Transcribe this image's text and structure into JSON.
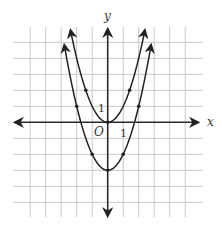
{
  "chart_data": {
    "type": "line",
    "title": "",
    "xlabel": "x",
    "ylabel": "y",
    "origin_label": "O",
    "tick_labels": {
      "x": "1",
      "y": "1"
    },
    "xlim": [
      -6,
      6
    ],
    "ylim": [
      -6,
      6
    ],
    "grid": true,
    "grid_x": [
      -5,
      -4,
      -3,
      -2,
      -1,
      0,
      1,
      2,
      3,
      4,
      5
    ],
    "grid_y": [
      -5,
      -4,
      -3,
      -2,
      -1,
      0,
      1,
      2,
      3,
      4,
      5
    ],
    "series": [
      {
        "name": "y = x^2",
        "equation": "y = x^2",
        "vertex": [
          0,
          0
        ],
        "points": [
          [
            -1.41,
            2
          ],
          [
            0,
            0
          ],
          [
            1.41,
            2
          ]
        ],
        "x_range": [
          -2.4,
          2.4
        ]
      },
      {
        "name": "y = x^2 - 3",
        "equation": "y = x^2 - 3",
        "vertex": [
          0,
          -3
        ],
        "points": [
          [
            -2,
            1
          ],
          [
            -1,
            -2
          ],
          [
            0,
            -3
          ],
          [
            1,
            -2
          ],
          [
            2,
            1
          ]
        ],
        "x_range": [
          -2.8,
          2.8
        ]
      }
    ],
    "legend": "none"
  },
  "colors": {
    "curve": "#222222",
    "axis": "#2a2a2a",
    "grid": "#c8c8c8"
  }
}
